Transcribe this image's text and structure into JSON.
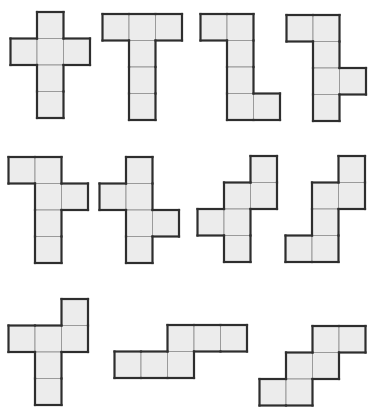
{
  "figure": {
    "cell_size": 26.5,
    "fill_color": "#ececec",
    "inner_line_color": "#9a9a9a",
    "outline_color": "#2e2e2e",
    "nets": [
      {
        "id": "net-1",
        "origin": [
          10.5,
          12
        ],
        "cells": [
          [
            1,
            0
          ],
          [
            0,
            1
          ],
          [
            1,
            1
          ],
          [
            2,
            1
          ],
          [
            1,
            2
          ],
          [
            1,
            3
          ]
        ]
      },
      {
        "id": "net-2",
        "origin": [
          102.5,
          14
        ],
        "cells": [
          [
            0,
            0
          ],
          [
            1,
            0
          ],
          [
            2,
            0
          ],
          [
            1,
            1
          ],
          [
            1,
            2
          ],
          [
            1,
            3
          ]
        ]
      },
      {
        "id": "net-3",
        "origin": [
          200.5,
          14
        ],
        "cells": [
          [
            0,
            0
          ],
          [
            1,
            0
          ],
          [
            1,
            1
          ],
          [
            1,
            2
          ],
          [
            1,
            3
          ],
          [
            2,
            3
          ]
        ]
      },
      {
        "id": "net-4",
        "origin": [
          286.5,
          15
        ],
        "cells": [
          [
            0,
            0
          ],
          [
            1,
            0
          ],
          [
            1,
            1
          ],
          [
            1,
            2
          ],
          [
            2,
            2
          ],
          [
            1,
            3
          ]
        ]
      },
      {
        "id": "net-5",
        "origin": [
          8.5,
          157
        ],
        "cells": [
          [
            0,
            0
          ],
          [
            1,
            0
          ],
          [
            1,
            1
          ],
          [
            2,
            1
          ],
          [
            1,
            2
          ],
          [
            1,
            3
          ]
        ]
      },
      {
        "id": "net-6",
        "origin": [
          99.5,
          157
        ],
        "cells": [
          [
            1,
            0
          ],
          [
            0,
            1
          ],
          [
            1,
            1
          ],
          [
            1,
            2
          ],
          [
            2,
            2
          ],
          [
            1,
            3
          ]
        ]
      },
      {
        "id": "net-7",
        "origin": [
          197.5,
          156
        ],
        "cells": [
          [
            2,
            0
          ],
          [
            1,
            1
          ],
          [
            2,
            1
          ],
          [
            0,
            2
          ],
          [
            1,
            2
          ],
          [
            1,
            3
          ]
        ]
      },
      {
        "id": "net-8",
        "origin": [
          285.5,
          156
        ],
        "cells": [
          [
            2,
            0
          ],
          [
            1,
            1
          ],
          [
            2,
            1
          ],
          [
            1,
            2
          ],
          [
            0,
            3
          ],
          [
            1,
            3
          ]
        ]
      },
      {
        "id": "net-9",
        "origin": [
          8.5,
          299
        ],
        "cells": [
          [
            2,
            0
          ],
          [
            0,
            1
          ],
          [
            1,
            1
          ],
          [
            2,
            1
          ],
          [
            1,
            2
          ],
          [
            1,
            3
          ]
        ]
      },
      {
        "id": "net-10",
        "origin": [
          114.5,
          325
        ],
        "cells": [
          [
            2,
            0
          ],
          [
            3,
            0
          ],
          [
            4,
            0
          ],
          [
            0,
            1
          ],
          [
            1,
            1
          ],
          [
            2,
            1
          ]
        ]
      },
      {
        "id": "net-11",
        "origin": [
          259.5,
          326
        ],
        "cells": [
          [
            2,
            0
          ],
          [
            3,
            0
          ],
          [
            1,
            1
          ],
          [
            2,
            1
          ],
          [
            0,
            2
          ],
          [
            1,
            2
          ]
        ]
      }
    ]
  }
}
